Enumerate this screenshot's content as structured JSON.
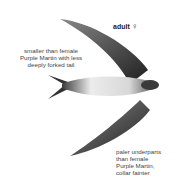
{
  "figure": {
    "title": "adult",
    "sex_symbol": "♀",
    "annotations": [
      {
        "lines": [
          "smaller than female",
          "Purple Martin with less",
          "deeply forked tail"
        ]
      },
      {
        "lines": [
          "paler underparts",
          "than female",
          "Purple Martin,",
          "collar fainter"
        ]
      }
    ],
    "colors": {
      "wing": "#2e2e2e",
      "belly": "#f2f2f2",
      "text": "#444444"
    }
  }
}
